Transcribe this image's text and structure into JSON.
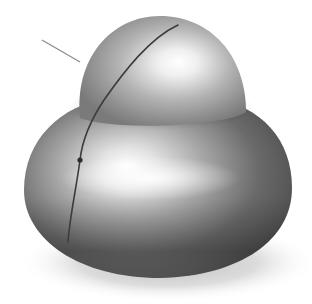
{
  "scene": {
    "description": "Shaded 3D surface of revolution (bell/mushroom shape) with a profile curve and leader line",
    "colors": {
      "background": "#ffffff",
      "highlight": "#ffffff",
      "midtone": "#a8a8a8",
      "shadow": "#4a4a4a",
      "profile_curve": "#3c3c3c",
      "leader_line": "#8a8a8a",
      "ground_shadow": "#d6d6d6"
    },
    "objects": [
      {
        "name": "top-dome",
        "type": "ellipsoid-cap"
      },
      {
        "name": "lower-bulge",
        "type": "toroidal-body"
      },
      {
        "name": "profile-curve",
        "type": "curve"
      },
      {
        "name": "curve-point",
        "type": "point"
      },
      {
        "name": "leader-line",
        "type": "line"
      },
      {
        "name": "ground-shadow",
        "type": "shadow"
      }
    ]
  }
}
